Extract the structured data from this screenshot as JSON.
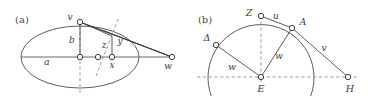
{
  "figure": {
    "background_color": "#ffffff",
    "stroke_color": "#3f3f3f",
    "axis_color": "#8a8a8a",
    "label_color": "#3a3a3a",
    "panels": [
      {
        "id": "a",
        "caption": "(a)",
        "caption_x": 22,
        "caption_y": 20,
        "description": "ellipse with semi-axes a and b, tangent construction through point z, foot x, height y, apex v, external point w",
        "ellipse": {
          "cx": 80,
          "cy": 57,
          "rx": 59,
          "ry": 31
        },
        "axes": [
          {
            "name": "major-axis",
            "type": "solid",
            "x1": 21,
            "y1": 57,
            "x2": 172,
            "y2": 57
          },
          {
            "name": "minor-axis",
            "type": "dashed",
            "x1": 80,
            "y1": 20,
            "x2": 80,
            "y2": 94
          }
        ],
        "segments": [
          {
            "name": "v-to-w",
            "x1": 80,
            "y1": 22,
            "x2": 172,
            "y2": 57
          },
          {
            "name": "v-to-tangent-point",
            "x1": 80,
            "y1": 22,
            "x2": 112,
            "y2": 36
          },
          {
            "name": "tangent-to-w",
            "x1": 104,
            "y1": 32,
            "x2": 172,
            "y2": 57
          },
          {
            "name": "y-ordinate",
            "x1": 112,
            "y1": 36,
            "x2": 112,
            "y2": 57
          },
          {
            "name": "normal-line",
            "x1": 97,
            "y1": 74,
            "x2": 118,
            "y2": 18
          },
          {
            "name": "b-segment",
            "x1": 80,
            "y1": 22,
            "x2": 80,
            "y2": 57
          }
        ],
        "points": [
          {
            "name": "v",
            "label": "v",
            "x": 80,
            "y": 22,
            "label_x": 70,
            "label_y": 17
          },
          {
            "name": "center",
            "label": "",
            "x": 80,
            "y": 57,
            "label_x": 80,
            "label_y": 57
          },
          {
            "name": "z",
            "label": "z",
            "x": 98,
            "y": 57,
            "label_x": 104,
            "label_y": 44
          },
          {
            "name": "x",
            "label": "x",
            "x": 112,
            "y": 57,
            "label_x": 112,
            "label_y": 64
          },
          {
            "name": "w",
            "label": "w",
            "x": 172,
            "y": 57,
            "label_x": 168,
            "label_y": 65
          }
        ],
        "labels": [
          {
            "name": "label-a",
            "text": "a",
            "x": 47,
            "y": 62
          },
          {
            "name": "label-b",
            "text": "b",
            "x": 72,
            "y": 40
          },
          {
            "name": "label-y",
            "text": "y",
            "x": 120,
            "y": 41
          }
        ]
      },
      {
        "id": "b",
        "caption": "(b)",
        "caption_x": 205,
        "caption_y": 20,
        "description": "semicircle centered at E with points Z, A, Delta on the arc, H on the horizontal axis, chords u, v, w",
        "circle": {
          "cx": 261,
          "cy": 77,
          "r": 53
        },
        "arc": {
          "start_angle_deg": 200,
          "end_angle_deg": 340,
          "note": "main drawn arc from lower-left through top to lower-right"
        },
        "axes": [
          {
            "name": "horizontal-axis",
            "type": "dashed",
            "x1": 197,
            "y1": 77,
            "x2": 357,
            "y2": 77
          },
          {
            "name": "vertical-axis",
            "type": "dashed",
            "x1": 261,
            "y1": 16,
            "x2": 261,
            "y2": 82
          }
        ],
        "segments": [
          {
            "name": "Z-to-A",
            "x1": 261,
            "y1": 16,
            "x2": 292,
            "y2": 28
          },
          {
            "name": "A-to-H",
            "x1": 292,
            "y1": 28,
            "x2": 348,
            "y2": 77
          },
          {
            "name": "E-to-A",
            "x1": 261,
            "y1": 77,
            "x2": 292,
            "y2": 28
          },
          {
            "name": "E-to-Delta",
            "x1": 261,
            "y1": 77,
            "x2": 216,
            "y2": 45
          }
        ],
        "points": [
          {
            "name": "Z",
            "label": "Z",
            "x": 261,
            "y": 16,
            "label_x": 249,
            "label_y": 13
          },
          {
            "name": "A",
            "label": "A",
            "x": 292,
            "y": 28,
            "label_x": 303,
            "label_y": 22
          },
          {
            "name": "Delta",
            "label": "Δ",
            "x": 216,
            "y": 45,
            "label_x": 207,
            "label_y": 38
          },
          {
            "name": "E",
            "label": "E",
            "x": 261,
            "y": 77,
            "label_x": 261,
            "label_y": 88
          },
          {
            "name": "H",
            "label": "H",
            "x": 348,
            "y": 77,
            "label_x": 350,
            "label_y": 88
          }
        ],
        "labels": [
          {
            "name": "label-u",
            "text": "u",
            "x": 276,
            "y": 16
          },
          {
            "name": "label-v",
            "text": "v",
            "x": 324,
            "y": 48
          },
          {
            "name": "label-w-right",
            "text": "w",
            "x": 279,
            "y": 55
          },
          {
            "name": "label-w-left",
            "text": "w",
            "x": 232,
            "y": 66
          }
        ]
      }
    ]
  }
}
